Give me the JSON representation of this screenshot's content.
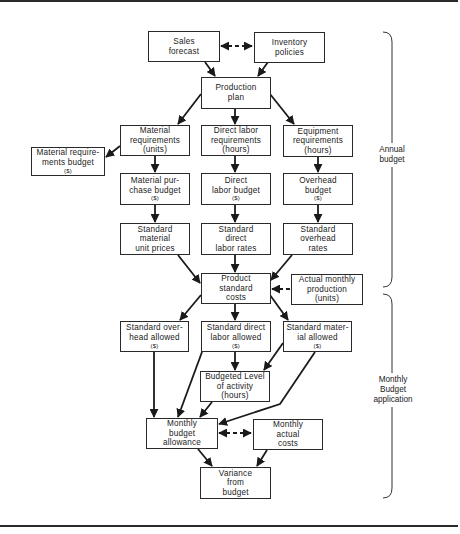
{
  "diagram": {
    "type": "flowchart",
    "nodes": {
      "sales_forecast": {
        "lines": [
          "Sales",
          "forecast"
        ]
      },
      "inventory_policies": {
        "lines": [
          "Inventory",
          "policies"
        ]
      },
      "production_plan": {
        "lines": [
          "Production",
          "plan"
        ]
      },
      "material_requirements": {
        "lines": [
          "Material",
          "requirements",
          "(units)"
        ]
      },
      "direct_labor_requirements": {
        "lines": [
          "Direct labor",
          "requirements",
          "(hours)"
        ]
      },
      "equipment_requirements": {
        "lines": [
          "Equipment",
          "requirements",
          "(hours)"
        ]
      },
      "material_requirements_budget": {
        "lines": [
          "Material require-",
          "ments budget"
        ],
        "unit": "($)"
      },
      "material_purchase_budget": {
        "lines": [
          "Material pur-",
          "chase budget"
        ],
        "unit": "($)"
      },
      "direct_labor_budget": {
        "lines": [
          "Direct",
          "labor budget"
        ],
        "unit": "($)"
      },
      "overhead_budget": {
        "lines": [
          "Overhead",
          "budget"
        ],
        "unit": "($)"
      },
      "standard_material_unit_prices": {
        "lines": [
          "Standard",
          "material",
          "unit prices"
        ]
      },
      "standard_direct_labor_rates": {
        "lines": [
          "Standard",
          "direct",
          "labor rates"
        ]
      },
      "standard_overhead_rates": {
        "lines": [
          "Standard",
          "overhead",
          "rates"
        ]
      },
      "product_standard_costs": {
        "lines": [
          "Product",
          "standard",
          "costs"
        ]
      },
      "actual_monthly_production": {
        "lines": [
          "Actual monthly",
          "production",
          "(units)"
        ]
      },
      "standard_overhead_allowed": {
        "lines": [
          "Standard over-",
          "head allowed"
        ],
        "unit": "($)"
      },
      "standard_direct_labor_allowed": {
        "lines": [
          "Standard direct",
          "labor allowed"
        ],
        "unit": "($)"
      },
      "standard_material_allowed": {
        "lines": [
          "Standard mater-",
          "ial allowed"
        ],
        "unit": "($)"
      },
      "budgeted_level_of_activity": {
        "lines": [
          "Budgeted Level",
          "of activity",
          "(hours)"
        ]
      },
      "monthly_budget_allowance": {
        "lines": [
          "Monthly",
          "budget",
          "allowance"
        ]
      },
      "monthly_actual_costs": {
        "lines": [
          "Monthly",
          "actual",
          "costs"
        ]
      },
      "variance_from_budget": {
        "lines": [
          "Variance",
          "from",
          "budget"
        ]
      }
    },
    "edges": [
      {
        "from": "sales_forecast",
        "to": "inventory_policies",
        "style": "dashed",
        "bidirectional": true
      },
      {
        "from": "sales_forecast",
        "to": "production_plan"
      },
      {
        "from": "inventory_policies",
        "to": "production_plan"
      },
      {
        "from": "production_plan",
        "to": "material_requirements"
      },
      {
        "from": "production_plan",
        "to": "direct_labor_requirements"
      },
      {
        "from": "production_plan",
        "to": "equipment_requirements"
      },
      {
        "from": "material_requirements",
        "to": "material_requirements_budget"
      },
      {
        "from": "material_requirements",
        "to": "material_purchase_budget"
      },
      {
        "from": "direct_labor_requirements",
        "to": "direct_labor_budget"
      },
      {
        "from": "equipment_requirements",
        "to": "overhead_budget"
      },
      {
        "from": "material_purchase_budget",
        "to": "standard_material_unit_prices"
      },
      {
        "from": "direct_labor_budget",
        "to": "standard_direct_labor_rates"
      },
      {
        "from": "overhead_budget",
        "to": "standard_overhead_rates"
      },
      {
        "from": "standard_material_unit_prices",
        "to": "product_standard_costs"
      },
      {
        "from": "standard_direct_labor_rates",
        "to": "product_standard_costs"
      },
      {
        "from": "standard_overhead_rates",
        "to": "product_standard_costs"
      },
      {
        "from": "actual_monthly_production",
        "to": "product_standard_costs",
        "style": "dashed"
      },
      {
        "from": "product_standard_costs",
        "to": "standard_overhead_allowed"
      },
      {
        "from": "product_standard_costs",
        "to": "standard_direct_labor_allowed"
      },
      {
        "from": "product_standard_costs",
        "to": "standard_material_allowed"
      },
      {
        "from": "standard_direct_labor_allowed",
        "to": "budgeted_level_of_activity"
      },
      {
        "from": "standard_material_allowed",
        "to": "budgeted_level_of_activity"
      },
      {
        "from": "standard_overhead_allowed",
        "to": "monthly_budget_allowance"
      },
      {
        "from": "standard_direct_labor_allowed",
        "to": "monthly_budget_allowance"
      },
      {
        "from": "budgeted_level_of_activity",
        "to": "monthly_budget_allowance"
      },
      {
        "from": "standard_material_allowed",
        "to": "monthly_budget_allowance"
      },
      {
        "from": "monthly_budget_allowance",
        "to": "monthly_actual_costs",
        "style": "dashed",
        "bidirectional": true
      },
      {
        "from": "monthly_budget_allowance",
        "to": "variance_from_budget"
      },
      {
        "from": "monthly_actual_costs",
        "to": "variance_from_budget"
      }
    ],
    "brackets": {
      "annual": {
        "lines": [
          "Annual",
          "budget"
        ]
      },
      "monthly": {
        "lines": [
          "Monthly",
          "Budget",
          "application"
        ]
      }
    }
  }
}
